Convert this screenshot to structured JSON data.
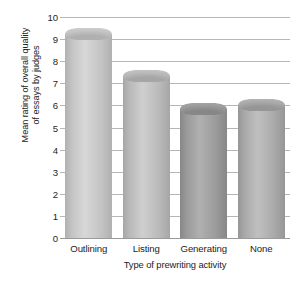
{
  "chart_data": {
    "type": "bar",
    "title": "",
    "subtitle": "",
    "xlabel": "Type of prewriting activity",
    "ylabel": "Mean rating of overall quality of essays by judges",
    "ylabel_line1": "Mean rating of overall quality",
    "ylabel_line2": "of essays by judges",
    "categories": [
      "Outlining",
      "Listing",
      "Generating",
      "None"
    ],
    "values": [
      9.5,
      7.6,
      6.1,
      6.3
    ],
    "ylim": [
      0,
      10
    ],
    "ytick_labels": [
      "10",
      "9",
      "8",
      "7",
      "6",
      "5",
      "4",
      "3",
      "2",
      "1",
      "0"
    ],
    "ytick_values": [
      10,
      9,
      8,
      7,
      6,
      5,
      4,
      3,
      2,
      1,
      0
    ],
    "grid": "horizontal",
    "legend": "none",
    "annotations": [],
    "style": "3d-cylinder-bars-grayscale",
    "bar_colors": [
      "#c3c3c3",
      "#b9b9b9",
      "#9a9a9a",
      "#a9a9a9"
    ],
    "bar_color_light": [
      "#d8d8d8",
      "#cfcfcf",
      "#b0b0b0",
      "#c0c0c0"
    ],
    "bar_color_dark": [
      "#b0b0b0",
      "#a6a6a6",
      "#878787",
      "#969696"
    ],
    "gridline_color": "#b6b6b6",
    "axis_color": "#9a9a9a",
    "background": "#ffffff"
  }
}
